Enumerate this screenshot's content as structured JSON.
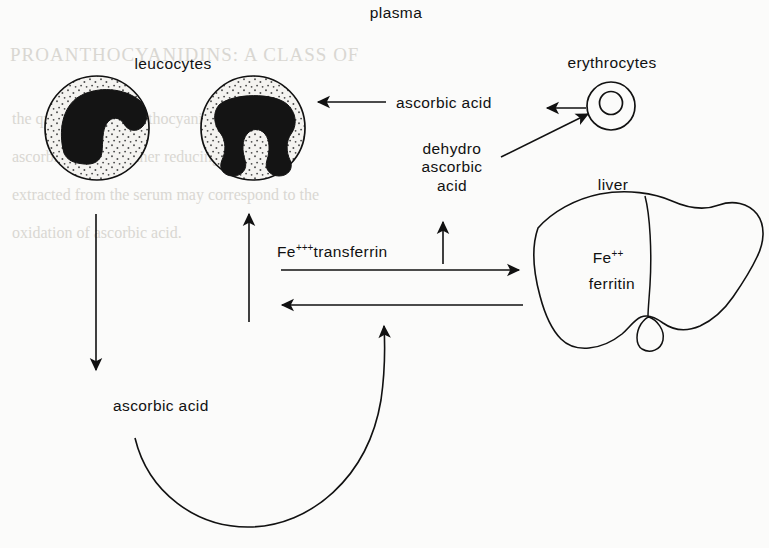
{
  "figure": {
    "title_label": "plasma",
    "labels": {
      "leucocytes": "leucocytes",
      "erythrocytes": "erythrocytes",
      "liver": "liver",
      "ascorbic_acid_plasma": "ascorbic acid",
      "dehydro_line1": "dehydro",
      "dehydro_line2": "ascorbic",
      "dehydro_line3": "acid",
      "ascorbic_acid_bottom": "ascorbic  acid",
      "transferrin_prefix": "Fe",
      "transferrin_charge": "+++",
      "transferrin_suffix": "transferrin",
      "liver_iron_prefix": "Fe",
      "liver_iron_charge": "++",
      "liver_ferritin": "ferritin"
    },
    "colors": {
      "ink": "#111111",
      "paper": "#fbfbfa",
      "nucleus": "#141414",
      "cytoplasm": "#f2f1ee",
      "stipple": "#4a4a4a",
      "ghost_text": "#d9d7d2"
    },
    "ghost_text": {
      "line1": "PROANTHOCYANIDINS: A CLASS OF",
      "line2": "the quantity of the anthocyanin",
      "line3": "ascorbic acid and other reducing",
      "line4": "extracted from the serum may correspond to the",
      "line5": "oxidation of ascorbic acid."
    },
    "arrows": [
      {
        "name": "leucocyte-to-ascorbic-down",
        "from": "leucocyte-1",
        "to": "ascorbic acid"
      },
      {
        "name": "transferrin-to-leucocyte-up",
        "from": "Fe+++transferrin",
        "to": "leucocyte-2"
      },
      {
        "name": "ascorbic-to-leucocyte-left",
        "from": "ascorbic acid",
        "to": "leucocyte-2"
      },
      {
        "name": "erythrocyte-to-ascorbic-left",
        "from": "erythrocytes",
        "to": "ascorbic acid"
      },
      {
        "name": "dehydro-to-erythrocyte-diagonal",
        "from": "dehydro ascorbic acid",
        "to": "erythrocytes"
      },
      {
        "name": "dehydro-up",
        "from": "liver pathway",
        "to": "dehydro ascorbic acid"
      },
      {
        "name": "transferrin-to-liver-right",
        "from": "Fe+++transferrin",
        "to": "liver"
      },
      {
        "name": "liver-to-plasma-left",
        "from": "liver",
        "to": "plasma"
      },
      {
        "name": "ascorbic-curve-to-plasma",
        "from": "ascorbic acid",
        "to": "liver pathway"
      }
    ]
  }
}
